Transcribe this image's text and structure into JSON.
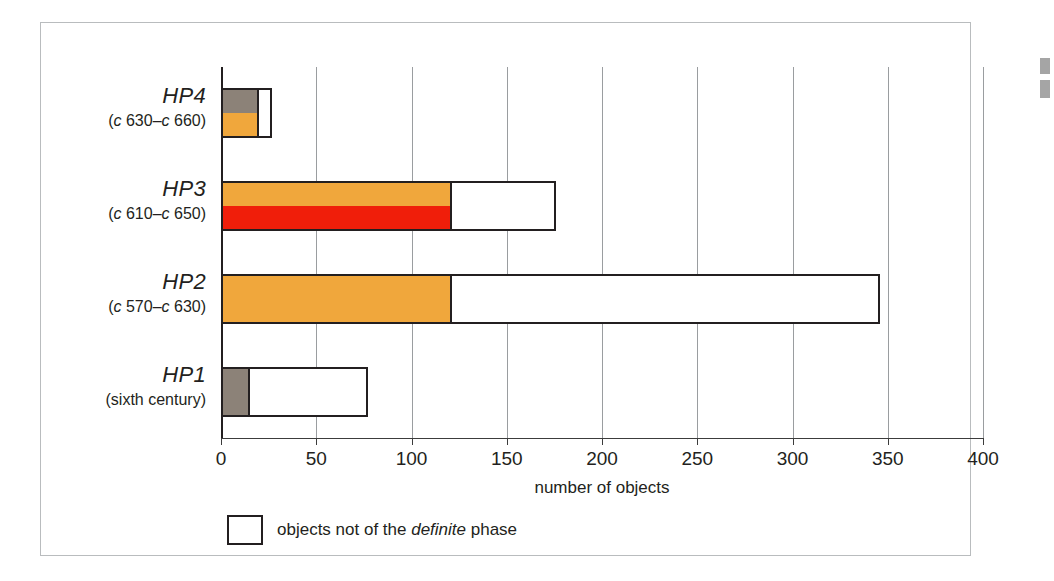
{
  "axis_title": "number of objects",
  "legend": {
    "swatch_name": "white-square-swatch",
    "text_before": "objects not of the ",
    "text_italic": "definite",
    "text_after": " phase"
  },
  "colors": {
    "orange": "#F0A73C",
    "red": "#F01E0A",
    "gray": "#8C8278",
    "white": "#FFFFFF",
    "outline": "#231F20",
    "gridline": "#9A9DA0",
    "frame": "#B9BCBE"
  },
  "chart_data": {
    "type": "bar",
    "orientation": "horizontal",
    "stacked": true,
    "title": "",
    "xlabel": "number of objects",
    "ylabel": "",
    "xlim": [
      0,
      400
    ],
    "xticks": [
      0,
      50,
      100,
      150,
      200,
      250,
      300,
      350,
      400
    ],
    "xtick_labels": [
      "0",
      "50",
      "100",
      "150",
      "200",
      "250",
      "300",
      "350",
      "400"
    ],
    "grid": true,
    "grid_axis": "x",
    "legend_position": "below-axis-left",
    "categories": [
      "HP4",
      "HP3",
      "HP2",
      "HP1"
    ],
    "category_labels": [
      {
        "name": "HP4",
        "range": "(c 630–c 660)",
        "range_prefix": "c",
        "range_from": "630",
        "range_to": "660"
      },
      {
        "name": "HP3",
        "range": "(c 610–c 650)",
        "range_prefix": "c",
        "range_from": "610",
        "range_to": "650"
      },
      {
        "name": "HP2",
        "range": "(c 570–c 630)",
        "range_prefix": "c",
        "range_from": "570",
        "range_to": "630"
      },
      {
        "name": "HP1",
        "range": "(sixth century)",
        "range_prefix": "",
        "range_from": "",
        "range_to": ""
      }
    ],
    "series": [
      {
        "name": "gray segment",
        "color": "#8C8278",
        "values": [
          19,
          0,
          0,
          14
        ]
      },
      {
        "name": "orange segment",
        "color": "#F0A73C",
        "values": [
          19,
          120,
          120,
          0
        ]
      },
      {
        "name": "red segment",
        "color": "#F01E0A",
        "values": [
          0,
          120,
          0,
          0
        ]
      },
      {
        "name": "objects not of the definite phase",
        "color": "#FFFFFF",
        "values": [
          8,
          56,
          226,
          63
        ]
      }
    ],
    "totals": [
      27,
      176,
      346,
      77
    ],
    "bars": [
      {
        "category": "HP4",
        "total": 27,
        "colored_extent": 19,
        "white_extent": 8,
        "split_type": "vertical-half",
        "upper_half_color": "#8C8278",
        "lower_half_color": "#F0A73C"
      },
      {
        "category": "HP3",
        "total": 176,
        "colored_extent": 120,
        "white_extent": 56,
        "split_type": "vertical-half",
        "upper_half_color": "#F0A73C",
        "lower_half_color": "#F01E0A"
      },
      {
        "category": "HP2",
        "total": 346,
        "colored_extent": 120,
        "white_extent": 226,
        "split_type": "solid",
        "upper_half_color": "#F0A73C",
        "lower_half_color": "#F0A73C"
      },
      {
        "category": "HP1",
        "total": 77,
        "colored_extent": 14,
        "white_extent": 63,
        "split_type": "solid",
        "upper_half_color": "#8C8278",
        "lower_half_color": "#8C8278"
      }
    ]
  }
}
